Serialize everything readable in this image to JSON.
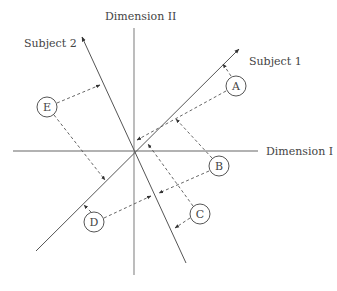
{
  "diagram": {
    "type": "vector projection diagram",
    "axes": {
      "dimension_1": {
        "label": "Dimension I"
      },
      "dimension_2": {
        "label": "Dimension II"
      }
    },
    "subject_vectors": [
      {
        "id": "subject-1",
        "label": "Subject 1"
      },
      {
        "id": "subject-2",
        "label": "Subject 2"
      }
    ],
    "stimuli": [
      {
        "id": "A",
        "label": "A"
      },
      {
        "id": "B",
        "label": "B"
      },
      {
        "id": "C",
        "label": "C"
      },
      {
        "id": "D",
        "label": "D"
      },
      {
        "id": "E",
        "label": "E"
      }
    ],
    "colors": {
      "axis": "#999999",
      "vector": "#555555",
      "projection": "#555555",
      "text": "#444444",
      "background": "#ffffff"
    }
  }
}
